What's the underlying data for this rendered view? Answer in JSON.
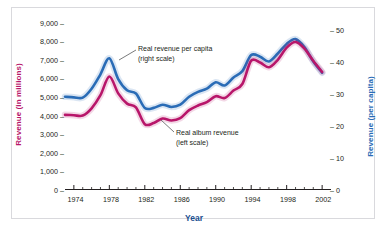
{
  "chart_data": {
    "type": "line",
    "title": "",
    "xlabel": "Year",
    "ylabel_left": "Revenue (in millions)",
    "ylabel_right": "Revenue (per capita)",
    "xlim": [
      1973,
      2003
    ],
    "ylim_left": [
      0,
      9000
    ],
    "ylim_right": [
      0,
      52.5
    ],
    "grid": false,
    "legend_position": "inline-annotations",
    "yticks_left": [
      "0",
      "1,000",
      "2,000",
      "3,000",
      "4,000",
      "5,000",
      "6,000",
      "7,000",
      "8,000",
      "9,000"
    ],
    "ytick_values_left": [
      0,
      1000,
      2000,
      3000,
      4000,
      5000,
      6000,
      7000,
      8000,
      9000
    ],
    "yticks_right": [
      "0",
      "10",
      "20",
      "30",
      "40",
      "50"
    ],
    "ytick_values_right": [
      0,
      10,
      20,
      30,
      40,
      50
    ],
    "xticks": [
      "1974",
      "1978",
      "1982",
      "1986",
      "1990",
      "1994",
      "1998",
      "2002"
    ],
    "xtick_values": [
      1974,
      1978,
      1982,
      1986,
      1990,
      1994,
      1998,
      2002
    ],
    "x": [
      1973,
      1974,
      1975,
      1976,
      1977,
      1978,
      1979,
      1980,
      1981,
      1982,
      1983,
      1984,
      1985,
      1986,
      1987,
      1988,
      1989,
      1990,
      1991,
      1992,
      1993,
      1994,
      1995,
      1996,
      1997,
      1998,
      1999,
      2000,
      2001,
      2002
    ],
    "series": [
      {
        "name": "Real revenue per capita",
        "scale": "right",
        "color": "#2a6cb6",
        "annotation": "Real revenue per capita\n(right scale)",
        "values": [
          29.0,
          28.8,
          28.7,
          31.5,
          36.0,
          41.0,
          34.5,
          31.0,
          30.0,
          25.5,
          25.5,
          26.5,
          25.8,
          26.5,
          29.0,
          30.5,
          31.5,
          33.5,
          32.5,
          35.0,
          37.0,
          42.0,
          41.5,
          40.0,
          42.5,
          45.5,
          47.0,
          44.5,
          40.0,
          36.5
        ]
      },
      {
        "name": "Real album revenue",
        "scale": "left",
        "color": "#b8166a",
        "annotation": "Real album revenue\n(left scale)",
        "values": [
          4000,
          3980,
          3960,
          4350,
          5050,
          6050,
          5150,
          4600,
          4400,
          3500,
          3560,
          3800,
          3700,
          3820,
          4250,
          4500,
          4680,
          5000,
          4900,
          5300,
          5650,
          6900,
          6800,
          6550,
          6950,
          7600,
          7900,
          7550,
          6900,
          6300
        ]
      }
    ],
    "annotations": [
      {
        "name": "blue-series-annotation",
        "line1": "Real revenue per capita",
        "line2": "(right scale)"
      },
      {
        "name": "red-series-annotation",
        "line1": "Real album revenue",
        "line2": "(left scale)"
      }
    ]
  }
}
